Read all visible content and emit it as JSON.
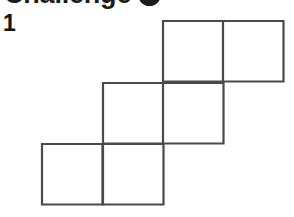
{
  "page": {
    "background_color": "#ffffff",
    "width": 294,
    "height": 217
  },
  "header": {
    "title": "Challenge",
    "badge_icon": "filled-circle-bullet-icon",
    "badge_color": "#1b1b1b",
    "clipped": "true"
  },
  "problem": {
    "number": "1"
  },
  "figure": {
    "name": "staircase-hexomino",
    "stroke_color": "#4a4a4a",
    "fill_color": "#ffffff",
    "stroke_width": 2.2,
    "cell_size": 60.5,
    "grid_columns": 4,
    "grid_rows": 3,
    "square_count": 6,
    "origin_x": 42,
    "origin_y": 21,
    "cells": [
      {
        "name": "cell-r0c2",
        "col": 2,
        "row": 0,
        "x": 163,
        "y": 21
      },
      {
        "name": "cell-r0c3",
        "col": 3,
        "row": 0,
        "x": 223,
        "y": 21
      },
      {
        "name": "cell-r1c1",
        "col": 1,
        "row": 1,
        "x": 103,
        "y": 83
      },
      {
        "name": "cell-r1c2",
        "col": 2,
        "row": 1,
        "x": 163,
        "y": 83
      },
      {
        "name": "cell-r2c0",
        "col": 0,
        "row": 2,
        "x": 42,
        "y": 144
      },
      {
        "name": "cell-r2c1",
        "col": 1,
        "row": 2,
        "x": 103,
        "y": 144
      }
    ]
  }
}
